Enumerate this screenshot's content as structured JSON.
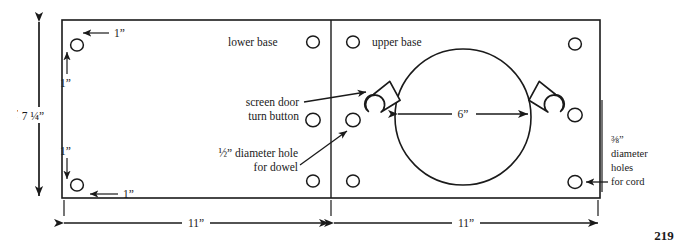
{
  "page": {
    "page_number": "219",
    "figure_type": "woodworking-plan-drawing"
  },
  "labels": {
    "lower_base": "lower base",
    "upper_base": "upper base",
    "screen_door": "screen door",
    "turn_button": "turn button",
    "dowel_hole_line1": "½” diameter hole",
    "dowel_hole_line2": "for dowel",
    "cord_holes_line1": "⅜”",
    "cord_holes_line2": "diameter",
    "cord_holes_line3": "holes",
    "cord_holes_line4": "for cord"
  },
  "dimensions": {
    "height_overall": "7 ¼”",
    "inset_top_horizontal": "1”",
    "inset_top_vertical": "1”",
    "inset_bottom_vertical": "1”",
    "inset_bottom_horizontal": "1”",
    "circle_diameter": "6”",
    "width_left_panel": "11”",
    "width_right_panel": "11”"
  },
  "geometry": {
    "panel": {
      "x": 62,
      "y": 20,
      "width": 538,
      "height": 178
    },
    "divider_x": 331,
    "big_circle": {
      "cx": 463,
      "cy": 117,
      "r": 68
    },
    "hole_radius": 6.2,
    "holes": [
      {
        "name": "hole-top-left-corner",
        "cx": 77,
        "cy": 45
      },
      {
        "name": "hole-bottom-left-corner",
        "cx": 77,
        "cy": 185
      },
      {
        "name": "hole-lower-base-top",
        "cx": 313,
        "cy": 42
      },
      {
        "name": "hole-lower-base-middle",
        "cx": 313,
        "cy": 120
      },
      {
        "name": "hole-lower-base-bottom",
        "cx": 313,
        "cy": 181
      },
      {
        "name": "hole-upper-base-top-left",
        "cx": 353,
        "cy": 42
      },
      {
        "name": "hole-dowel-left",
        "cx": 353,
        "cy": 120
      },
      {
        "name": "hole-upper-base-bottom-left",
        "cx": 353,
        "cy": 181
      },
      {
        "name": "hole-upper-base-top-right",
        "cx": 575,
        "cy": 44
      },
      {
        "name": "hole-dowel-right",
        "cx": 575,
        "cy": 115
      },
      {
        "name": "hole-cord-bottom-right",
        "cx": 575,
        "cy": 182
      }
    ],
    "turn_buttons": [
      {
        "name": "turn-button-left",
        "cx": 381,
        "cy": 100,
        "rotate": -42
      },
      {
        "name": "turn-button-right",
        "cx": 548,
        "cy": 100,
        "rotate": 42
      }
    ]
  },
  "colors": {
    "ink": "#1a1a1a",
    "paper": "#ffffff"
  }
}
